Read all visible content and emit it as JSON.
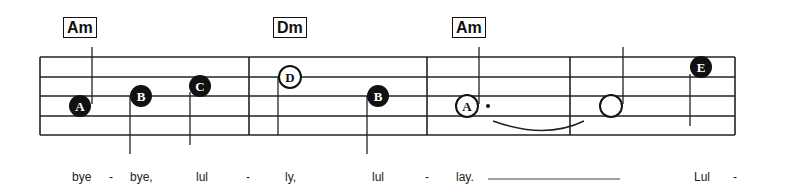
{
  "score": {
    "chords": [
      {
        "label": "Am",
        "x": 63
      },
      {
        "label": "Dm",
        "x": 273
      },
      {
        "label": "Am",
        "x": 452
      }
    ],
    "notes": [
      {
        "letter": "A",
        "style": "filled",
        "duration": "quarter"
      },
      {
        "letter": "B",
        "style": "filled",
        "duration": "quarter"
      },
      {
        "letter": "C",
        "style": "filled",
        "duration": "quarter"
      },
      {
        "letter": "D",
        "style": "open-letter",
        "duration": "half"
      },
      {
        "letter": "B",
        "style": "filled",
        "duration": "quarter"
      },
      {
        "letter": "A",
        "style": "open-letter",
        "duration": "dotted-half"
      },
      {
        "letter": "",
        "style": "open",
        "duration": "half"
      },
      {
        "letter": "E",
        "style": "filled",
        "duration": "quarter"
      }
    ],
    "lyrics": [
      {
        "text": "bye",
        "x": 72
      },
      {
        "text": "-",
        "x": 109
      },
      {
        "text": "bye,",
        "x": 130
      },
      {
        "text": "lul",
        "x": 196
      },
      {
        "text": "-",
        "x": 246
      },
      {
        "text": "ly,",
        "x": 285
      },
      {
        "text": "lul",
        "x": 372
      },
      {
        "text": "-",
        "x": 425
      },
      {
        "text": "lay.",
        "x": 456
      },
      {
        "text": "Lul",
        "x": 694
      },
      {
        "text": "-",
        "x": 733
      }
    ]
  }
}
